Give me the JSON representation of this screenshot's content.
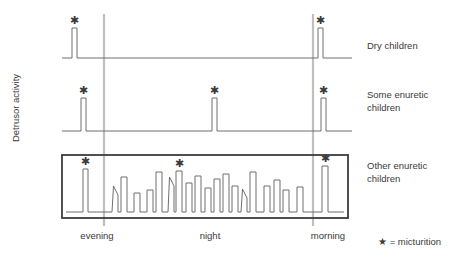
{
  "figure": {
    "ylabel": "Detrusor activity",
    "legend_note": "★ = micturition",
    "star_glyph": "✱"
  },
  "time_labels": [
    {
      "id": "evening",
      "label": "evening",
      "x": 62,
      "y": 230,
      "width": 70
    },
    {
      "id": "night",
      "label": "night",
      "x": 175,
      "y": 230,
      "width": 70
    },
    {
      "id": "morning",
      "label": "morning",
      "x": 293,
      "y": 230,
      "width": 70
    }
  ],
  "series_labels": [
    {
      "id": "dry-children",
      "label": "Dry children",
      "x": 367,
      "y": 39
    },
    {
      "id": "some-enuretic-children",
      "label": "Some enuretic\nchildren",
      "x": 367,
      "y": 88
    },
    {
      "id": "other-enuretic-children",
      "label": "Other enuretic\nchildren",
      "x": 367,
      "y": 159
    }
  ],
  "dividers": [
    {
      "id": "evening-night-divider",
      "x": 104,
      "y1": 14,
      "y2": 226
    },
    {
      "id": "night-morning-divider",
      "x": 313,
      "y1": 14,
      "y2": 226
    }
  ],
  "group_box": {
    "x": 62,
    "y": 155,
    "width": 286,
    "height": 63
  },
  "chart_data": {
    "type": "line",
    "title": "",
    "xlabel": "",
    "ylabel": "Detrusor activity",
    "grid": false,
    "legend_position": "right",
    "x_axis": {
      "range": [
        62,
        352
      ],
      "segments": [
        {
          "name": "evening",
          "from": 62,
          "to": 104
        },
        {
          "name": "night",
          "from": 104,
          "to": 313
        },
        {
          "name": "morning",
          "from": 313,
          "to": 352
        }
      ],
      "tick_labels": [
        "evening",
        "night",
        "morning"
      ]
    },
    "series": [
      {
        "name": "Dry children",
        "baseline_y": 58,
        "x_start": 62,
        "x_end": 352,
        "peaks": [
          {
            "x0": 72,
            "x1": 77,
            "top": 28,
            "micturition": true
          },
          {
            "x0": 318,
            "x1": 323,
            "top": 28,
            "micturition": true
          }
        ]
      },
      {
        "name": "Some enuretic children",
        "baseline_y": 131,
        "x_start": 62,
        "x_end": 352,
        "peaks": [
          {
            "x0": 81,
            "x1": 86,
            "top": 98,
            "micturition": true
          },
          {
            "x0": 212,
            "x1": 217,
            "top": 98,
            "micturition": true
          },
          {
            "x0": 321,
            "x1": 326,
            "top": 98,
            "micturition": true
          }
        ]
      },
      {
        "name": "Other enuretic children",
        "baseline_y": 212,
        "x_start": 66,
        "x_end": 344,
        "boxed": true,
        "peaks": [
          {
            "x0": 83,
            "x1": 88,
            "top": 169,
            "micturition": true
          },
          {
            "x0": 112,
            "x1": 118,
            "top": 186,
            "slant": true
          },
          {
            "x0": 121,
            "x1": 127,
            "top": 177
          },
          {
            "x0": 134,
            "x1": 140,
            "top": 193
          },
          {
            "x0": 147,
            "x1": 153,
            "top": 190
          },
          {
            "x0": 156,
            "x1": 162,
            "top": 172
          },
          {
            "x0": 168,
            "x1": 174,
            "top": 177,
            "slant": true
          },
          {
            "x0": 176,
            "x1": 182,
            "top": 171,
            "micturition": true
          },
          {
            "x0": 186,
            "x1": 192,
            "top": 183
          },
          {
            "x0": 195,
            "x1": 201,
            "top": 176
          },
          {
            "x0": 205,
            "x1": 211,
            "top": 188
          },
          {
            "x0": 214,
            "x1": 220,
            "top": 179
          },
          {
            "x0": 223,
            "x1": 229,
            "top": 174
          },
          {
            "x0": 232,
            "x1": 238,
            "top": 186
          },
          {
            "x0": 241,
            "x1": 247,
            "top": 189,
            "slant": true
          },
          {
            "x0": 250,
            "x1": 256,
            "top": 172
          },
          {
            "x0": 264,
            "x1": 270,
            "top": 186
          },
          {
            "x0": 274,
            "x1": 280,
            "top": 180
          },
          {
            "x0": 283,
            "x1": 289,
            "top": 190
          },
          {
            "x0": 297,
            "x1": 303,
            "top": 187
          },
          {
            "x0": 322,
            "x1": 328,
            "top": 166,
            "micturition": true
          }
        ]
      }
    ]
  }
}
